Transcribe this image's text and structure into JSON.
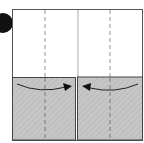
{
  "diagram": {
    "type": "origami-fold-step",
    "step_marker": {
      "shape": "filled-circle",
      "color": "#111111"
    },
    "paper": {
      "color": "#ffffff",
      "border": "#555555"
    },
    "flaps": [
      {
        "name": "left-flap",
        "color": "#c4c4c4",
        "arrow": "fold toward center (right)"
      },
      {
        "name": "right-flap",
        "color": "#c4c4c4",
        "arrow": "fold toward center (left)"
      }
    ],
    "lines": {
      "valley_fold_dashed": 2,
      "center_crease_solid": 1
    }
  }
}
